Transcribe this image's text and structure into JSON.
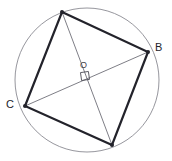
{
  "figure": {
    "type": "geometry-diagram",
    "canvas": {
      "width": 172,
      "height": 161,
      "background": "#ffffff"
    },
    "colors": {
      "background": "#ffffff",
      "circle_stroke": "#8a8a92",
      "quad_stroke": "#23232b",
      "diagonal_stroke": "#6f6f78",
      "label_color": "#23232b",
      "center_label_color": "#44444c",
      "marker_stroke": "#55555e"
    },
    "circle": {
      "name": "circumcircle",
      "center_x": 87,
      "center_y": 80,
      "radius": 72,
      "stroke_width": 0.9
    },
    "center_point": {
      "label": "O",
      "x": 87,
      "y": 80,
      "label_x": 80,
      "label_y": 61
    },
    "right_angle_marker": {
      "label": "right-angle-square",
      "x": 81,
      "y": 72,
      "size": 8,
      "rotation_deg": -8
    },
    "vertices": [
      {
        "id": "top",
        "label": "",
        "x": 62,
        "y": 12
      },
      {
        "id": "right",
        "label": "B",
        "x": 148,
        "y": 52
      },
      {
        "id": "bottom",
        "label": "",
        "x": 112,
        "y": 145
      },
      {
        "id": "left",
        "label": "C",
        "x": 25,
        "y": 106
      }
    ],
    "vertex_labels": [
      {
        "text": "B",
        "x": 155,
        "y": 42
      },
      {
        "text": "C",
        "x": 6,
        "y": 99
      }
    ],
    "quadrilateral": {
      "name": "inscribed-quadrilateral",
      "points": "62,12 148,52 112,145 25,106",
      "stroke_width": 2.2
    },
    "diagonals": [
      {
        "id": "diagonal-top-bottom",
        "x1": 62,
        "y1": 12,
        "x2": 112,
        "y2": 145,
        "stroke_width": 0.9
      },
      {
        "id": "diagonal-left-right",
        "x1": 25,
        "y1": 106,
        "x2": 148,
        "y2": 52,
        "stroke_width": 0.9
      }
    ],
    "vertex_dot_radius": 2.0
  }
}
